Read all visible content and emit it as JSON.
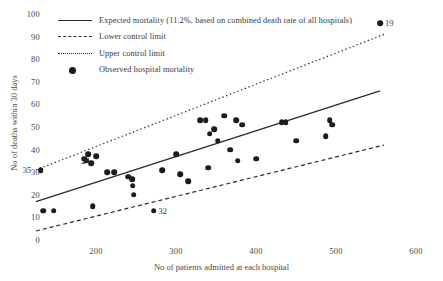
{
  "chart_data": {
    "type": "scatter",
    "title": "",
    "xlabel": "No of patients admitted at each hospital",
    "ylabel": "No of deaths within 30 days",
    "xlim": [
      120,
      600
    ],
    "ylim": [
      0,
      100
    ],
    "xticks": [
      200,
      300,
      400,
      500,
      600
    ],
    "yticks": [
      0,
      10,
      20,
      30,
      40,
      50,
      60,
      70,
      80,
      90,
      100
    ],
    "grid": false,
    "legend_position": "top-left",
    "legend": [
      {
        "key": "solid-line",
        "label": "Expected mortality (11.2%, based on combined death rate of all hospitals)"
      },
      {
        "key": "dashed-line",
        "label": "Lower control limit"
      },
      {
        "key": "dotted-line",
        "label": "Upper control limit"
      },
      {
        "key": "filled-circle",
        "label": "Observed hospital mortality"
      }
    ],
    "series": [
      {
        "name": "Expected mortality",
        "type": "line",
        "style": "solid",
        "points": [
          [
            125,
            17
          ],
          [
            555,
            66
          ]
        ]
      },
      {
        "name": "Lower control limit",
        "type": "line",
        "style": "dashed",
        "points": [
          [
            125,
            4
          ],
          [
            560,
            42
          ]
        ]
      },
      {
        "name": "Upper control limit",
        "type": "line",
        "style": "dotted",
        "points": [
          [
            125,
            31
          ],
          [
            560,
            91
          ]
        ]
      },
      {
        "name": "Observed hospital mortality",
        "type": "scatter",
        "points": [
          {
            "x": 131,
            "y": 31,
            "label": "35"
          },
          {
            "x": 134,
            "y": 13
          },
          {
            "x": 147,
            "y": 13
          },
          {
            "x": 185,
            "y": 36
          },
          {
            "x": 188,
            "y": 35
          },
          {
            "x": 190,
            "y": 38
          },
          {
            "x": 194,
            "y": 34
          },
          {
            "x": 196,
            "y": 15
          },
          {
            "x": 200,
            "y": 37,
            "label": "24"
          },
          {
            "x": 214,
            "y": 30
          },
          {
            "x": 223,
            "y": 30
          },
          {
            "x": 240,
            "y": 28
          },
          {
            "x": 245,
            "y": 27
          },
          {
            "x": 246,
            "y": 24
          },
          {
            "x": 247,
            "y": 20
          },
          {
            "x": 272,
            "y": 13,
            "label": "32"
          },
          {
            "x": 283,
            "y": 31
          },
          {
            "x": 300,
            "y": 38
          },
          {
            "x": 305,
            "y": 29
          },
          {
            "x": 315,
            "y": 26
          },
          {
            "x": 330,
            "y": 53
          },
          {
            "x": 337,
            "y": 53
          },
          {
            "x": 340,
            "y": 32
          },
          {
            "x": 342,
            "y": 47
          },
          {
            "x": 348,
            "y": 49
          },
          {
            "x": 352,
            "y": 44
          },
          {
            "x": 360,
            "y": 55
          },
          {
            "x": 368,
            "y": 40
          },
          {
            "x": 375,
            "y": 53
          },
          {
            "x": 377,
            "y": 35
          },
          {
            "x": 383,
            "y": 51
          },
          {
            "x": 400,
            "y": 36
          },
          {
            "x": 432,
            "y": 52
          },
          {
            "x": 437,
            "y": 52
          },
          {
            "x": 450,
            "y": 44
          },
          {
            "x": 487,
            "y": 46
          },
          {
            "x": 492,
            "y": 53
          },
          {
            "x": 495,
            "y": 51
          },
          {
            "x": 555,
            "y": 96,
            "label": "19"
          }
        ]
      }
    ]
  }
}
